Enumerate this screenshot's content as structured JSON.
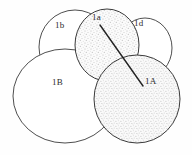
{
  "figure": {
    "kind": "botanical-cell-diagram",
    "background_color": "#fefefe",
    "outline_color": "#3a3a3a",
    "label_color": "#2b2b2b",
    "shade_color": "#cfcfcf",
    "leader_line_color": "#232323",
    "width": 192,
    "height": 155
  },
  "shapes": [
    {
      "id": "cell-1b",
      "label": "1b",
      "shaded": false,
      "cx": 75,
      "cy": 47,
      "rx": 36,
      "ry": 37,
      "label_x": 55,
      "label_y": 26
    },
    {
      "id": "cell-1a",
      "label": "1a",
      "shaded": true,
      "cx": 107,
      "cy": 45,
      "rx": 32,
      "ry": 36,
      "label_x": 92,
      "label_y": 18
    },
    {
      "id": "cell-1d",
      "label": "1d",
      "shaded": false,
      "cx": 145,
      "cy": 48,
      "rx": 27,
      "ry": 30,
      "label_x": 134,
      "label_y": 24
    },
    {
      "id": "cell-1B",
      "label": "1B",
      "shaded": false,
      "cx": 65,
      "cy": 96,
      "rx": 52,
      "ry": 47,
      "label_x": 52,
      "label_y": 82
    },
    {
      "id": "cell-1A",
      "label": "1A",
      "shaded": true,
      "cx": 137,
      "cy": 99,
      "rx": 43,
      "ry": 44,
      "label_x": 145,
      "label_y": 80
    }
  ],
  "leader_line": {
    "id": "leader-1a-to-1A",
    "x1": 100,
    "y1": 25,
    "x2": 143,
    "y2": 86
  }
}
